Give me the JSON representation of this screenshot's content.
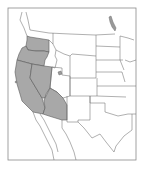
{
  "map": {
    "region": "Western United States",
    "highlighted_states": [
      "Washington",
      "Oregon",
      "California",
      "Nevada",
      "Arizona"
    ],
    "colors": {
      "highlight_fill": "#a8a8a8",
      "highlight_stroke": "#5a5a5a",
      "border": "#6e6e6e",
      "background": "#ffffff",
      "frame": "#8a8a8a"
    }
  }
}
